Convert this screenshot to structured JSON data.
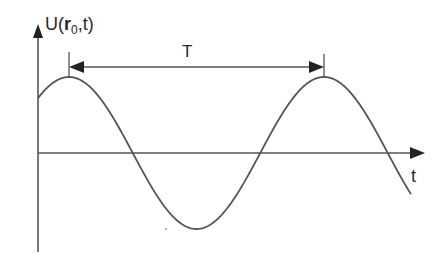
{
  "diagram": {
    "y_axis_label": {
      "prefix": "U(",
      "bold_var": "r",
      "subscript": "0",
      "suffix": ",t)"
    },
    "x_axis_label": "t",
    "period_label": "T",
    "curve": {
      "type": "sine",
      "period_label": "T",
      "cycles_shown": 1.6,
      "description": "Cosine-like wave starting at positive value, peaking, dipping to a trough, rising to second peak one period later, and descending past zero"
    },
    "colors": {
      "stroke": "#555555",
      "text": "#2a2a2a",
      "background": "#ffffff"
    }
  }
}
